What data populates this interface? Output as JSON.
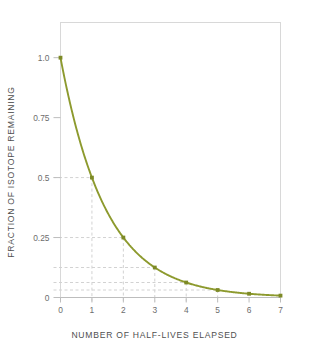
{
  "chart_data": {
    "type": "line",
    "title": "",
    "xlabel": "NUMBER OF HALF-LIVES ELAPSED",
    "ylabel": "FRACTION OF ISOTOPE REMAINING",
    "x": [
      0,
      1,
      2,
      3,
      4,
      5,
      6,
      7
    ],
    "values": [
      1.0,
      0.5,
      0.25,
      0.125,
      0.0625,
      0.03125,
      0.015625,
      0.0078125
    ],
    "series": [
      {
        "name": "fraction remaining",
        "values": [
          1.0,
          0.5,
          0.25,
          0.125,
          0.0625,
          0.03125,
          0.015625,
          0.0078125
        ]
      }
    ],
    "xlim": [
      0,
      7
    ],
    "ylim": [
      0,
      1.08
    ],
    "xticks": [
      0,
      1,
      2,
      3,
      4,
      5,
      6,
      7
    ],
    "xticklabels": [
      "0",
      "1",
      "2",
      "3",
      "4",
      "5",
      "6",
      "7"
    ],
    "yticks": [
      0,
      0.25,
      0.5,
      0.75,
      1.0
    ],
    "yticklabels": [
      "0",
      "0.25",
      "0.5",
      "0.75",
      "1.0"
    ],
    "guide_levels": [
      0.5,
      0.25,
      0.125,
      0.0625,
      0.03125
    ],
    "guide_x": [
      1,
      2,
      3,
      4,
      5
    ],
    "grid": false,
    "legend": false,
    "line_color": "#8d9a2e",
    "marker_color": "#7d8a26",
    "guide_color": "#d2d2d2",
    "frame_color": "#d8d8d8",
    "text_color": "#5a5a5a",
    "marker": "square"
  },
  "axes": {
    "x_tick_labels": [
      "0",
      "1",
      "2",
      "3",
      "4",
      "5",
      "6",
      "7"
    ],
    "y_tick_labels": [
      "0",
      "0.25",
      "0.5",
      "0.75",
      "1.0"
    ]
  }
}
